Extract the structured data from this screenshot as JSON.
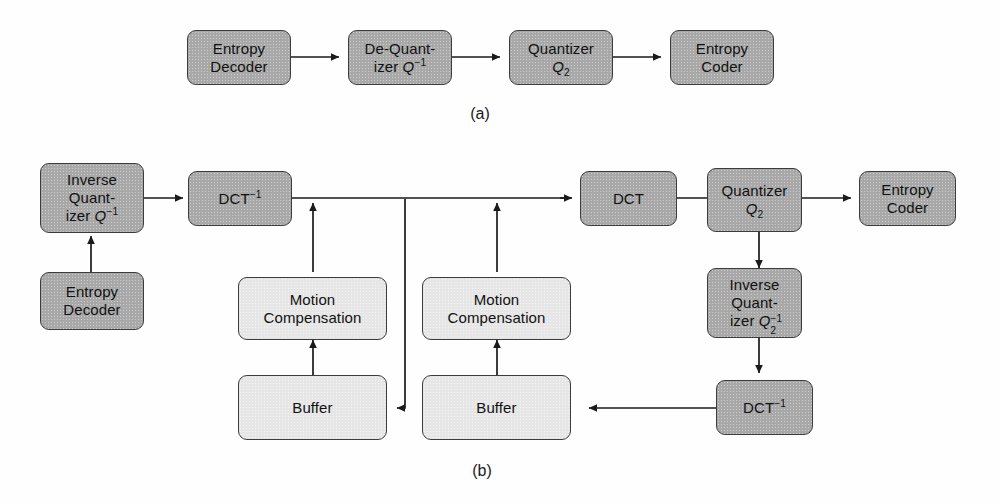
{
  "figure": {
    "type": "block-diagram",
    "captions": [
      {
        "id": "a",
        "text": "(a)"
      },
      {
        "id": "b",
        "text": "(b)"
      }
    ],
    "colors": {
      "dark_block": "#a8a8a8",
      "light_block": "#e6e6e6",
      "outline": "#3c3c3c",
      "wire": "#1a1a1a",
      "background": "#ffffff"
    }
  },
  "diagram_a": {
    "caption": "(a)",
    "blocks": [
      {
        "id": "a_entropy_decoder",
        "label": "Entropy\nDecoder",
        "lines": [
          "Entropy",
          "Decoder"
        ],
        "shade": "dark"
      },
      {
        "id": "a_dequantizer",
        "label": "De-Quant-\nizer Q⁻¹",
        "lines": [
          "De-Quant-",
          "izer Q⁻¹"
        ],
        "shade": "dark"
      },
      {
        "id": "a_quantizer",
        "label": "Quantizer\nQ₂",
        "lines": [
          "Quantizer",
          "Q₂"
        ],
        "shade": "dark"
      },
      {
        "id": "a_entropy_coder",
        "label": "Entropy\nCoder",
        "lines": [
          "Entropy",
          "Coder"
        ],
        "shade": "dark"
      }
    ],
    "connections": [
      {
        "from": "a_entropy_decoder",
        "to": "a_dequantizer",
        "arrow": "right"
      },
      {
        "from": "a_dequantizer",
        "to": "a_quantizer",
        "arrow": "right"
      },
      {
        "from": "a_quantizer",
        "to": "a_entropy_coder",
        "arrow": "right"
      }
    ]
  },
  "diagram_b": {
    "caption": "(b)",
    "blocks": [
      {
        "id": "b_inverse_quantizer",
        "label": "Inverse\nQuant-\nizer Q⁻¹",
        "lines": [
          "Inverse",
          "Quant-",
          "izer Q⁻¹"
        ],
        "shade": "dark"
      },
      {
        "id": "b_entropy_decoder",
        "label": "Entropy\nDecoder",
        "lines": [
          "Entropy",
          "Decoder"
        ],
        "shade": "dark"
      },
      {
        "id": "b_idct_left",
        "label": "DCT⁻¹",
        "lines": [
          "DCT⁻¹"
        ],
        "shade": "dark"
      },
      {
        "id": "b_motion_comp_left",
        "label": "Motion\nCompensation",
        "lines": [
          "Motion",
          "Compensation"
        ],
        "shade": "light"
      },
      {
        "id": "b_buffer_left",
        "label": "Buffer",
        "lines": [
          "Buffer"
        ],
        "shade": "light"
      },
      {
        "id": "b_motion_comp_right",
        "label": "Motion\nCompensation",
        "lines": [
          "Motion",
          "Compensation"
        ],
        "shade": "light"
      },
      {
        "id": "b_buffer_right",
        "label": "Buffer",
        "lines": [
          "Buffer"
        ],
        "shade": "light"
      },
      {
        "id": "b_dct",
        "label": "DCT",
        "lines": [
          "DCT"
        ],
        "shade": "dark"
      },
      {
        "id": "b_quantizer",
        "label": "Quantizer\nQ₂",
        "lines": [
          "Quantizer",
          "Q₂"
        ],
        "shade": "dark"
      },
      {
        "id": "b_entropy_coder",
        "label": "Entropy\nCoder",
        "lines": [
          "Entropy",
          "Coder"
        ],
        "shade": "dark"
      },
      {
        "id": "b_inverse_quantizer_2",
        "label": "Inverse\nQuant-\nizer Q₂⁻¹",
        "lines": [
          "Inverse",
          "Quant-",
          "izer Q₂⁻¹"
        ],
        "shade": "dark"
      },
      {
        "id": "b_idct_right",
        "label": "DCT⁻¹",
        "lines": [
          "DCT⁻¹"
        ],
        "shade": "dark"
      }
    ],
    "connections": [
      {
        "from": "b_entropy_decoder",
        "to": "b_inverse_quantizer",
        "arrow": "up"
      },
      {
        "from": "b_inverse_quantizer",
        "to": "b_idct_left",
        "arrow": "right"
      },
      {
        "from": "b_motion_comp_left",
        "to": "b_idct_left_output",
        "arrow": "up"
      },
      {
        "from": "b_buffer_left",
        "to": "b_motion_comp_left",
        "arrow": "up"
      },
      {
        "from": "b_idct_left",
        "to": "b_buffer_left",
        "arrow": "left"
      },
      {
        "from": "b_idct_left",
        "to": "b_dct",
        "arrow": "right"
      },
      {
        "from": "b_motion_comp_right",
        "to": "b_dct_input",
        "arrow": "up"
      },
      {
        "from": "b_buffer_right",
        "to": "b_motion_comp_right",
        "arrow": "up"
      },
      {
        "from": "b_dct",
        "to": "b_quantizer",
        "arrow": "right"
      },
      {
        "from": "b_quantizer",
        "to": "b_entropy_coder",
        "arrow": "right"
      },
      {
        "from": "b_quantizer",
        "to": "b_inverse_quantizer_2",
        "arrow": "down"
      },
      {
        "from": "b_inverse_quantizer_2",
        "to": "b_idct_right",
        "arrow": "down"
      },
      {
        "from": "b_idct_right",
        "to": "b_buffer_right",
        "arrow": "left"
      }
    ]
  },
  "labels": {
    "entropy": "Entropy",
    "decoder": "Decoder",
    "coder": "Coder",
    "de_quant_1": "De-Quant-",
    "de_quant_2": "izer ",
    "quantizer": "Quantizer",
    "inverse": "Inverse",
    "quant_hyphen": "Quant-",
    "izer": "izer ",
    "dct": "DCT",
    "motion": "Motion",
    "compensation": "Compensation",
    "buffer": "Buffer",
    "q": "Q",
    "sup_minus1": "−1",
    "sub_2": "2"
  }
}
